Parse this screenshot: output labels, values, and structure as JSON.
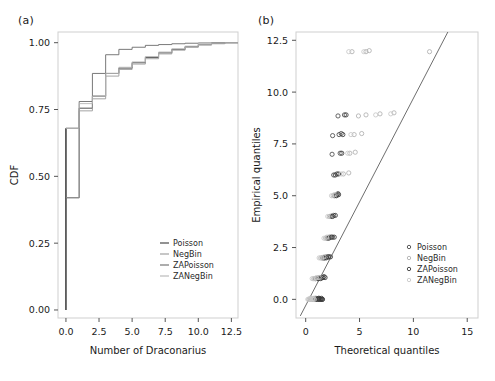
{
  "figure": {
    "panels": [
      {
        "tag": "(a)",
        "type": "step-cdf"
      },
      {
        "tag": "(b)",
        "type": "qq-scatter"
      }
    ]
  },
  "chart_data": [
    {
      "type": "line",
      "panel": "(a)",
      "title": "",
      "xlabel": "Number of Draconarius",
      "ylabel": "CDF",
      "xlim": [
        -0.6,
        13.0
      ],
      "ylim": [
        -0.03,
        1.04
      ],
      "xticks": [
        0.0,
        2.5,
        5.0,
        7.5,
        10.0,
        12.5
      ],
      "xtick_labels": [
        "0.0",
        "2.5",
        "5.0",
        "7.5",
        "10.0",
        "12.5"
      ],
      "yticks": [
        0.0,
        0.25,
        0.5,
        0.75,
        1.0
      ],
      "ytick_labels": [
        "0.00",
        "0.25",
        "0.50",
        "0.75",
        "1.00"
      ],
      "grid": false,
      "drawstyle": "steps-post",
      "legend_position": "lower-right",
      "series": [
        {
          "name": "Poisson",
          "color": "#3a3a3a",
          "x": [
            0,
            1,
            2,
            3,
            4,
            5,
            6,
            7,
            8,
            9,
            10,
            11,
            12
          ],
          "y": [
            0.42,
            0.755,
            0.8,
            0.885,
            0.905,
            0.925,
            0.945,
            0.962,
            0.975,
            0.985,
            0.993,
            0.997,
            1.0
          ]
        },
        {
          "name": "NegBin",
          "color": "#9a9a9a",
          "x": [
            0,
            1,
            2,
            3,
            4,
            5,
            6,
            7,
            8,
            9,
            10,
            11,
            12
          ],
          "y": [
            0.42,
            0.745,
            0.79,
            0.875,
            0.9,
            0.92,
            0.94,
            0.958,
            0.972,
            0.983,
            0.991,
            0.996,
            1.0
          ]
        },
        {
          "name": "ZAPoisson",
          "color": "#6a6a6a",
          "x": [
            0,
            1,
            2,
            3,
            4,
            5,
            6,
            7,
            8,
            9,
            10,
            11,
            12
          ],
          "y": [
            0.68,
            0.78,
            0.885,
            0.955,
            0.975,
            0.983,
            0.99,
            0.993,
            0.996,
            0.998,
            0.999,
            1.0,
            1.0
          ]
        },
        {
          "name": "ZANegBin",
          "color": "#b5b5b5",
          "x": [
            0,
            1,
            2,
            3,
            4,
            5,
            6,
            7,
            8,
            9,
            10,
            11,
            12
          ],
          "y": [
            0.68,
            0.772,
            0.8,
            0.885,
            0.908,
            0.928,
            0.948,
            0.965,
            0.977,
            0.987,
            0.994,
            0.998,
            1.0
          ]
        }
      ],
      "vertical_rise_at_zero": {
        "from": 0.0,
        "to": 0.68
      }
    },
    {
      "type": "scatter",
      "panel": "(b)",
      "title": "",
      "xlabel": "Theoretical quantiles",
      "ylabel": "Empirical quantiles",
      "xlim": [
        -0.9,
        16.0
      ],
      "ylim": [
        -0.9,
        12.9
      ],
      "xticks": [
        0,
        5,
        10,
        15
      ],
      "xtick_labels": [
        "0",
        "5",
        "10",
        "15"
      ],
      "yticks": [
        0.0,
        2.5,
        5.0,
        7.5,
        10.0,
        12.5
      ],
      "ytick_labels": [
        "0.0",
        "2.5",
        "5.0",
        "7.5",
        "10.0",
        "12.5"
      ],
      "grid": false,
      "legend_position": "middle-right",
      "reference_line": {
        "x": [
          -0.5,
          13.2
        ],
        "y": [
          -0.8,
          12.9
        ],
        "color": "#6e6e6e"
      },
      "series": [
        {
          "name": "Poisson",
          "color": "#4a4a4a",
          "marker": "circle",
          "points": [
            [
              0.55,
              0.0
            ],
            [
              0.7,
              0.0
            ],
            [
              0.85,
              0.0
            ],
            [
              1.0,
              0.0
            ],
            [
              1.15,
              0.0
            ],
            [
              1.3,
              0.0
            ],
            [
              1.45,
              0.0
            ],
            [
              1.55,
              0.0
            ],
            [
              0.95,
              0.05
            ],
            [
              1.25,
              0.05
            ],
            [
              0.9,
              1.0
            ],
            [
              1.1,
              1.0
            ],
            [
              1.3,
              1.05
            ],
            [
              1.5,
              1.05
            ],
            [
              1.7,
              1.1
            ],
            [
              1.55,
              2.0
            ],
            [
              1.75,
              2.0
            ],
            [
              1.95,
              2.05
            ],
            [
              2.15,
              2.05
            ],
            [
              2.0,
              2.95
            ],
            [
              2.25,
              3.0
            ],
            [
              2.5,
              3.0
            ],
            [
              2.35,
              4.0
            ],
            [
              2.6,
              4.05
            ],
            [
              2.7,
              5.0
            ],
            [
              2.9,
              5.05
            ],
            [
              3.0,
              5.1
            ],
            [
              2.6,
              6.0
            ],
            [
              2.9,
              6.05
            ],
            [
              2.45,
              7.0
            ],
            [
              3.2,
              7.05
            ],
            [
              2.5,
              7.9
            ],
            [
              3.1,
              7.95
            ],
            [
              3.3,
              8.0
            ],
            [
              3.0,
              8.85
            ],
            [
              3.6,
              8.9
            ]
          ]
        },
        {
          "name": "NegBin",
          "color": "#b0b0b0",
          "marker": "circle",
          "points": [
            [
              0.3,
              0.0
            ],
            [
              0.45,
              0.0
            ],
            [
              0.6,
              0.0
            ],
            [
              0.75,
              0.0
            ],
            [
              0.9,
              0.0
            ],
            [
              1.05,
              0.0
            ],
            [
              0.5,
              0.05
            ],
            [
              0.8,
              0.05
            ],
            [
              0.75,
              1.0
            ],
            [
              0.95,
              1.0
            ],
            [
              1.15,
              1.05
            ],
            [
              1.4,
              1.05
            ],
            [
              1.4,
              2.0
            ],
            [
              1.6,
              2.0
            ],
            [
              1.85,
              2.05
            ],
            [
              2.05,
              2.05
            ],
            [
              1.85,
              2.95
            ],
            [
              2.1,
              3.0
            ],
            [
              2.35,
              3.0
            ],
            [
              2.2,
              4.0
            ],
            [
              2.45,
              4.05
            ],
            [
              2.55,
              5.0
            ],
            [
              2.8,
              5.05
            ],
            [
              3.5,
              6.05
            ],
            [
              4.0,
              6.1
            ],
            [
              4.1,
              7.05
            ],
            [
              4.6,
              7.1
            ],
            [
              4.5,
              7.95
            ],
            [
              5.2,
              8.0
            ],
            [
              4.9,
              8.85
            ],
            [
              5.6,
              8.9
            ],
            [
              6.9,
              8.95
            ],
            [
              8.2,
              9.0
            ],
            [
              4.3,
              11.95
            ],
            [
              5.6,
              11.95
            ],
            [
              5.9,
              12.0
            ],
            [
              11.5,
              11.95
            ]
          ]
        },
        {
          "name": "ZAPoisson",
          "color": "#3a3a3a",
          "marker": "circle",
          "points": [
            [
              0.95,
              0.0
            ],
            [
              1.1,
              0.0
            ],
            [
              1.25,
              0.0
            ],
            [
              1.4,
              0.0
            ],
            [
              1.55,
              0.0
            ],
            [
              1.2,
              0.05
            ],
            [
              1.45,
              0.05
            ],
            [
              1.2,
              1.0
            ],
            [
              1.4,
              1.0
            ],
            [
              1.6,
              1.05
            ],
            [
              1.8,
              1.05
            ],
            [
              1.7,
              2.0
            ],
            [
              1.9,
              2.0
            ],
            [
              2.1,
              2.05
            ],
            [
              2.3,
              2.05
            ],
            [
              2.15,
              2.95
            ],
            [
              2.4,
              3.0
            ],
            [
              2.65,
              3.0
            ],
            [
              2.5,
              4.0
            ],
            [
              2.75,
              4.05
            ],
            [
              2.85,
              5.0
            ],
            [
              3.05,
              5.05
            ],
            [
              2.75,
              6.0
            ],
            [
              3.05,
              6.05
            ],
            [
              3.35,
              7.05
            ],
            [
              3.45,
              7.95
            ],
            [
              3.75,
              8.9
            ]
          ]
        },
        {
          "name": "ZANegBin",
          "color": "#c8c8c8",
          "marker": "circle",
          "points": [
            [
              0.2,
              0.0
            ],
            [
              0.35,
              0.0
            ],
            [
              0.5,
              0.0
            ],
            [
              0.65,
              0.0
            ],
            [
              0.8,
              0.0
            ],
            [
              0.4,
              0.05
            ],
            [
              0.7,
              0.05
            ],
            [
              0.6,
              1.0
            ],
            [
              0.8,
              1.0
            ],
            [
              1.0,
              1.05
            ],
            [
              1.25,
              1.05
            ],
            [
              1.25,
              2.0
            ],
            [
              1.5,
              2.0
            ],
            [
              1.7,
              2.05
            ],
            [
              1.7,
              2.95
            ],
            [
              1.95,
              3.0
            ],
            [
              2.05,
              4.0
            ],
            [
              2.4,
              5.0
            ],
            [
              2.65,
              5.05
            ],
            [
              3.3,
              6.05
            ],
            [
              3.9,
              7.05
            ],
            [
              4.2,
              7.95
            ],
            [
              6.5,
              8.9
            ],
            [
              7.9,
              8.95
            ],
            [
              4.0,
              11.95
            ],
            [
              5.4,
              11.95
            ]
          ]
        }
      ]
    }
  ],
  "panel_a": {
    "tag": "(a)",
    "xlabel": "Number of Draconarius",
    "ylabel": "CDF",
    "legend": [
      {
        "label": "Poisson",
        "color": "#3a3a3a"
      },
      {
        "label": "NegBin",
        "color": "#9a9a9a"
      },
      {
        "label": "ZAPoisson",
        "color": "#6a6a6a"
      },
      {
        "label": "ZANegBin",
        "color": "#b5b5b5"
      }
    ]
  },
  "panel_b": {
    "tag": "(b)",
    "xlabel": "Theoretical quantiles",
    "ylabel": "Empirical quantiles",
    "legend": [
      {
        "label": "Poisson",
        "color": "#4a4a4a"
      },
      {
        "label": "NegBin",
        "color": "#b0b0b0"
      },
      {
        "label": "ZAPoisson",
        "color": "#3a3a3a"
      },
      {
        "label": "ZANegBin",
        "color": "#c8c8c8"
      }
    ]
  }
}
